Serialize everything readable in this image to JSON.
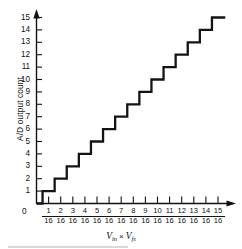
{
  "chart_data": {
    "type": "line",
    "title": "",
    "subtitle": "",
    "xlabel": "Vin × Vfs",
    "ylabel": "A/D output count",
    "xlabel_parts": {
      "v1": "V",
      "v1_sub": "in",
      "operator": "×",
      "v2": "V",
      "v2_sub": "fs"
    },
    "grid": false,
    "legend": null,
    "xlim": [
      0,
      16
    ],
    "ylim": [
      0,
      15
    ],
    "x_tick_values": [
      1,
      2,
      3,
      4,
      5,
      6,
      7,
      8,
      9,
      10,
      11,
      12,
      13,
      14,
      15
    ],
    "x_tick_denominator": "16",
    "x_tick_labels": [
      "1/16",
      "2/16",
      "3/16",
      "4/16",
      "5/16",
      "6/16",
      "7/16",
      "8/16",
      "9/16",
      "10/16",
      "11/16",
      "12/16",
      "13/16",
      "14/16",
      "15/16"
    ],
    "y_tick_labels": [
      "0",
      "1",
      "2",
      "3",
      "4",
      "5",
      "6",
      "7",
      "8",
      "9",
      "10",
      "11",
      "12",
      "13",
      "14",
      "15"
    ],
    "y_tick_values": [
      0,
      1,
      2,
      3,
      4,
      5,
      6,
      7,
      8,
      9,
      10,
      11,
      12,
      13,
      14,
      15
    ],
    "origin_label": "0",
    "step_transitions_x_sixteenths": [
      0.5,
      1.5,
      2.5,
      3.5,
      4.5,
      5.5,
      6.5,
      7.5,
      8.5,
      9.5,
      10.5,
      11.5,
      12.5,
      13.5,
      14.5
    ],
    "step_levels": [
      0,
      1,
      2,
      3,
      4,
      5,
      6,
      7,
      8,
      9,
      10,
      11,
      12,
      13,
      14,
      15
    ],
    "series": [
      {
        "name": "A/D output count",
        "color": "#141414",
        "points": [
          {
            "x": 0.0,
            "y": 0
          },
          {
            "x": 0.5,
            "y": 0
          },
          {
            "x": 0.5,
            "y": 1
          },
          {
            "x": 1.5,
            "y": 1
          },
          {
            "x": 1.5,
            "y": 2
          },
          {
            "x": 2.5,
            "y": 2
          },
          {
            "x": 2.5,
            "y": 3
          },
          {
            "x": 3.5,
            "y": 3
          },
          {
            "x": 3.5,
            "y": 4
          },
          {
            "x": 4.5,
            "y": 4
          },
          {
            "x": 4.5,
            "y": 5
          },
          {
            "x": 5.5,
            "y": 5
          },
          {
            "x": 5.5,
            "y": 6
          },
          {
            "x": 6.5,
            "y": 6
          },
          {
            "x": 6.5,
            "y": 7
          },
          {
            "x": 7.5,
            "y": 7
          },
          {
            "x": 7.5,
            "y": 8
          },
          {
            "x": 8.5,
            "y": 8
          },
          {
            "x": 8.5,
            "y": 9
          },
          {
            "x": 9.5,
            "y": 9
          },
          {
            "x": 9.5,
            "y": 10
          },
          {
            "x": 10.5,
            "y": 10
          },
          {
            "x": 10.5,
            "y": 11
          },
          {
            "x": 11.5,
            "y": 11
          },
          {
            "x": 11.5,
            "y": 12
          },
          {
            "x": 12.5,
            "y": 12
          },
          {
            "x": 12.5,
            "y": 13
          },
          {
            "x": 13.5,
            "y": 13
          },
          {
            "x": 13.5,
            "y": 14
          },
          {
            "x": 14.5,
            "y": 14
          },
          {
            "x": 14.5,
            "y": 15
          },
          {
            "x": 15.6,
            "y": 15
          }
        ]
      }
    ],
    "axis_arrows": {
      "x_axis_arrow": true,
      "y_axis_arrow": true
    },
    "colors": {
      "axis": "#111111",
      "curve": "#141414",
      "background": "#ffffff",
      "text": "#111111"
    }
  }
}
